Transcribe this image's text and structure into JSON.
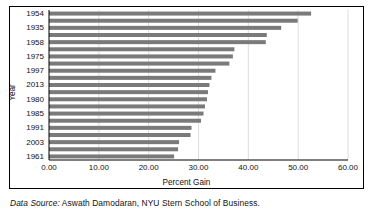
{
  "caption": {
    "source_label": "Data Source:",
    "source_text": " Aswath Damodaran, NYU Stern School of Business."
  },
  "chart_data": {
    "type": "bar",
    "orientation": "horizontal",
    "title": "",
    "xlabel": "Percent Gain",
    "ylabel": "Year",
    "xlim": [
      0.0,
      60.0
    ],
    "grid": true,
    "legend": null,
    "bar_color": "#7a7a7a",
    "xticks": [
      "0.00",
      "10.00",
      "20.00",
      "30.00",
      "40.00",
      "50.00",
      "60.00"
    ],
    "xtick_values": [
      0,
      10,
      20,
      30,
      40,
      50,
      60
    ],
    "categories": [
      "1954",
      "1958",
      "1935",
      "1975",
      "1958",
      "1995",
      "1975",
      "1989",
      "1997",
      "2013",
      "1955",
      "1980",
      "1985",
      "1950",
      "1991",
      "1938",
      "2003",
      "1936",
      "1961",
      "1998",
      "1943"
    ],
    "ytick_labels": [
      "1954",
      "1935",
      "1958",
      "1975",
      "1997",
      "2013",
      "1980",
      "1985",
      "1991",
      "2003",
      "1961",
      "1943"
    ],
    "values": [
      52.6,
      49.9,
      46.6,
      43.7,
      43.5,
      37.2,
      36.9,
      36.2,
      33.4,
      32.6,
      32.2,
      31.9,
      31.7,
      31.3,
      31.0,
      30.5,
      28.6,
      28.4,
      26.1,
      25.9,
      25.1
    ],
    "values_detail": [
      {
        "year": "1954",
        "percent_gain": 52.6
      },
      {
        "year": "1958",
        "percent_gain": 49.9
      },
      {
        "year": "1935",
        "percent_gain": 46.6
      },
      {
        "year": "1975",
        "percent_gain": 43.7
      },
      {
        "year": "1958",
        "percent_gain": 43.5
      },
      {
        "year": "1995",
        "percent_gain": 37.2
      },
      {
        "year": "1975",
        "percent_gain": 36.9
      },
      {
        "year": "1989",
        "percent_gain": 36.2
      },
      {
        "year": "1997",
        "percent_gain": 33.4
      },
      {
        "year": "2013",
        "percent_gain": 32.6
      },
      {
        "year": "1955",
        "percent_gain": 32.2
      },
      {
        "year": "1980",
        "percent_gain": 31.9
      },
      {
        "year": "1985",
        "percent_gain": 31.7
      },
      {
        "year": "1950",
        "percent_gain": 31.3
      },
      {
        "year": "1991",
        "percent_gain": 31.0
      },
      {
        "year": "1938",
        "percent_gain": 30.5
      },
      {
        "year": "2003",
        "percent_gain": 28.6
      },
      {
        "year": "1936",
        "percent_gain": 28.4
      },
      {
        "year": "1961",
        "percent_gain": 26.1
      },
      {
        "year": "1998",
        "percent_gain": 25.9
      },
      {
        "year": "1943",
        "percent_gain": 25.1
      }
    ]
  }
}
